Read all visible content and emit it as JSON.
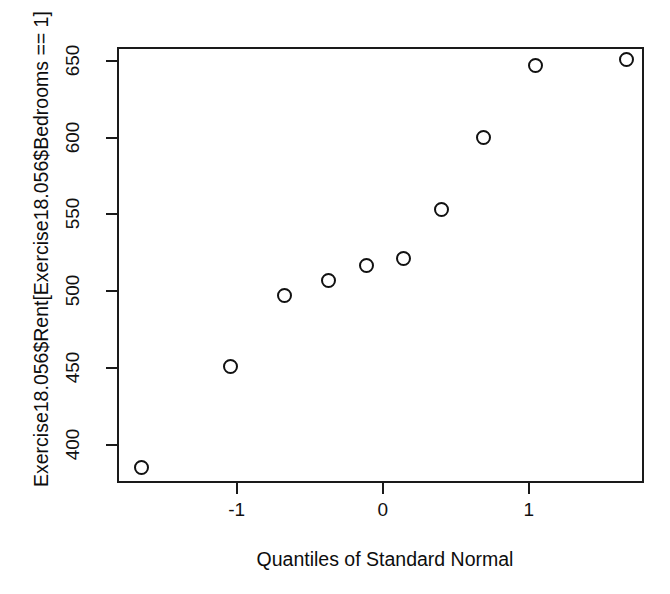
{
  "chart_data": {
    "type": "scatter",
    "title": "",
    "xlabel": "Quantiles of Standard Normal",
    "ylabel": "Exercise18.056$Rent[Exercise18.056$Bedrooms == 1]",
    "xlim": [
      -1.82,
      1.79
    ],
    "ylim": [
      375,
      659
    ],
    "grid": false,
    "legend": "none",
    "marker": "open-circle",
    "xticks": [
      -1,
      0,
      1
    ],
    "xticklabels": [
      "-1",
      "0",
      "1"
    ],
    "yticks": [
      400,
      450,
      500,
      550,
      600,
      650
    ],
    "yticklabels": [
      "400",
      "450",
      "500",
      "550",
      "600",
      "650"
    ],
    "x": [
      -1.65,
      -1.04,
      -0.67,
      -0.37,
      -0.11,
      0.14,
      0.4,
      0.69,
      1.05,
      1.67
    ],
    "y": [
      385,
      451,
      497,
      507,
      517,
      521,
      553,
      600,
      647,
      651
    ],
    "points": [
      {
        "x": -1.65,
        "y": 385
      },
      {
        "x": -1.04,
        "y": 451
      },
      {
        "x": -0.67,
        "y": 497
      },
      {
        "x": -0.37,
        "y": 507
      },
      {
        "x": -0.11,
        "y": 517
      },
      {
        "x": 0.14,
        "y": 521
      },
      {
        "x": 0.4,
        "y": 553
      },
      {
        "x": 0.69,
        "y": 600
      },
      {
        "x": 1.05,
        "y": 647
      },
      {
        "x": 1.67,
        "y": 651
      }
    ]
  },
  "colors": {
    "background": "#ffffff",
    "axis": "#1a1a1a",
    "marker_stroke": "#111111",
    "text": "#0d0d0d"
  }
}
